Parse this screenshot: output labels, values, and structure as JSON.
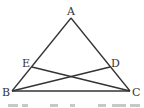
{
  "diagram": {
    "type": "geometry-triangle",
    "points": {
      "A": {
        "label": "A",
        "x": 71,
        "y": 18
      },
      "B": {
        "label": "B",
        "x": 12,
        "y": 91
      },
      "C": {
        "label": "C",
        "x": 130,
        "y": 91
      },
      "D": {
        "label": "D",
        "x": 110,
        "y": 67
      },
      "E": {
        "label": "E",
        "x": 32,
        "y": 67
      }
    },
    "segments": [
      "AB",
      "AC",
      "BC",
      "BD",
      "CE"
    ],
    "stroke_color": "#333333"
  },
  "caption": {
    "text": "",
    "note": "clipped"
  }
}
